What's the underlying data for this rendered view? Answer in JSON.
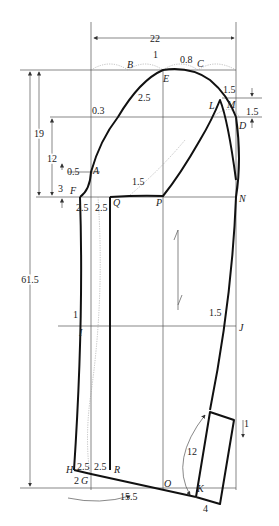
{
  "diagram": {
    "dimensions": {
      "width_top": "22",
      "total_length": "61.5",
      "cap_height_outer": "19",
      "cap_height_inner": "12",
      "a_offset": "0.5",
      "f_offset": "3",
      "b_offset": "0.3",
      "b_ease": "2.5",
      "e_offset": "1",
      "c_offset": "0.8",
      "m_offset": "1.5",
      "d_offset": "1.5",
      "p_offset": "1.5",
      "f_seam_left": "2.5",
      "f_seam_right": "2.5",
      "elbow_in": "1",
      "elbow_out": "1.5",
      "hem_seam_left": "2.5",
      "hem_seam_right": "2.5",
      "hem_drop": "2",
      "cuff_width": "15.5",
      "vent_length": "12",
      "vent_width": "4",
      "vent_drop": "1"
    },
    "points": {
      "A": "A",
      "B": "B",
      "C": "C",
      "D": "D",
      "E": "E",
      "F": "F",
      "G": "G",
      "H": "H",
      "I": "I",
      "J": "J",
      "K": "K",
      "L": "L",
      "M": "M",
      "N": "N",
      "O": "O",
      "P": "P",
      "Q": "Q",
      "R": "R"
    },
    "grain_arrow": "grainline-arrow"
  }
}
